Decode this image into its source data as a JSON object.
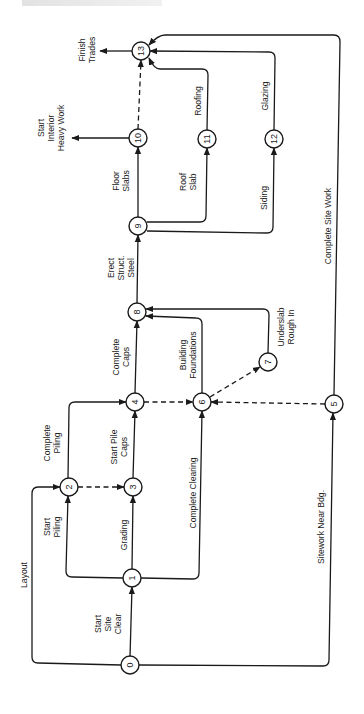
{
  "diagram": {
    "type": "activity-on-arrow network (rotated 90°)",
    "colors": {
      "stroke": "#1a1a1a",
      "background": "#ffffff"
    },
    "nodes": [
      {
        "id": "0",
        "x": 130,
        "y": 665
      },
      {
        "id": "1",
        "x": 132,
        "y": 578
      },
      {
        "id": "2",
        "x": 69,
        "y": 487
      },
      {
        "id": "3",
        "x": 133,
        "y": 487
      },
      {
        "id": "4",
        "x": 135,
        "y": 402
      },
      {
        "id": "5",
        "x": 334,
        "y": 404
      },
      {
        "id": "6",
        "x": 202,
        "y": 402
      },
      {
        "id": "7",
        "x": 268,
        "y": 362
      },
      {
        "id": "8",
        "x": 137,
        "y": 312
      },
      {
        "id": "9",
        "x": 138,
        "y": 226
      },
      {
        "id": "10",
        "x": 138,
        "y": 138
      },
      {
        "id": "11",
        "x": 207,
        "y": 139
      },
      {
        "id": "12",
        "x": 274,
        "y": 139
      },
      {
        "id": "13",
        "x": 141,
        "y": 51
      }
    ],
    "edges": [
      {
        "from": "0",
        "to": "1",
        "label": "Start Site Clear",
        "dashed": false
      },
      {
        "from": "0",
        "to": "2",
        "label": "Layout",
        "dashed": false
      },
      {
        "from": "0",
        "to": "5",
        "label": "Sitework Near Bdg.",
        "dashed": false
      },
      {
        "from": "1",
        "to": "2",
        "label": "Start Piling",
        "dashed": false
      },
      {
        "from": "1",
        "to": "3",
        "label": "Grading",
        "dashed": false
      },
      {
        "from": "1",
        "to": "6",
        "label": "Complete Clearing",
        "dashed": false
      },
      {
        "from": "2",
        "to": "3",
        "label": "",
        "dashed": true
      },
      {
        "from": "2",
        "to": "4",
        "label": "Complete Piling",
        "dashed": false
      },
      {
        "from": "3",
        "to": "4",
        "label": "Start Pile Caps",
        "dashed": false
      },
      {
        "from": "4",
        "to": "6",
        "label": "",
        "dashed": true
      },
      {
        "from": "4",
        "to": "8",
        "label": "Complete Caps",
        "dashed": false
      },
      {
        "from": "5",
        "to": "6",
        "label": "",
        "dashed": true
      },
      {
        "from": "5",
        "to": "13",
        "label": "Complete Site Work",
        "dashed": false
      },
      {
        "from": "6",
        "to": "7",
        "label": "",
        "dashed": true
      },
      {
        "from": "6",
        "to": "8",
        "label": "Building Foundations",
        "dashed": false
      },
      {
        "from": "7",
        "to": "8",
        "label": "Underslab Rough In",
        "dashed": false
      },
      {
        "from": "8",
        "to": "9",
        "label": "Erect Struct. Steel",
        "dashed": false
      },
      {
        "from": "9",
        "to": "10",
        "label": "Floor Slabs",
        "dashed": false
      },
      {
        "from": "9",
        "to": "11",
        "label": "Roof Slab",
        "dashed": false
      },
      {
        "from": "9",
        "to": "12",
        "label": "Siding",
        "dashed": false
      },
      {
        "from": "10",
        "to": "13",
        "label": "",
        "dashed": true
      },
      {
        "from": "10",
        "to": "out",
        "label": "Start Interior Heavy Work",
        "dashed": false
      },
      {
        "from": "11",
        "to": "13",
        "label": "Roofing",
        "dashed": false
      },
      {
        "from": "12",
        "to": "13",
        "label": "Glazing",
        "dashed": false
      },
      {
        "from": "13",
        "to": "out",
        "label": "Finish Trades",
        "dashed": false
      }
    ],
    "labels": {
      "layout": [
        "Layout"
      ],
      "start_site_clear": [
        "Start",
        "Site",
        "Clear"
      ],
      "start_piling": [
        "Start",
        "Piling"
      ],
      "grading": [
        "Grading"
      ],
      "complete_clearing": [
        "Complete Clearing"
      ],
      "complete_piling": [
        "Complete",
        "Piling"
      ],
      "start_pile_caps": [
        "Start Pile",
        "Caps"
      ],
      "sitework_near_bdg": [
        "Sitework Near Bdg."
      ],
      "complete_caps": [
        "Complete",
        "Caps"
      ],
      "building_foundations": [
        "Building",
        "Foundations"
      ],
      "underslab_rough_in": [
        "Underslab",
        "Rough In"
      ],
      "erect_struct_steel": [
        "Erect",
        "Struct.",
        "Steel"
      ],
      "floor_slabs": [
        "Floor",
        "Slabs"
      ],
      "roof_slab": [
        "Roof",
        "Slab"
      ],
      "siding": [
        "Siding"
      ],
      "roofing": [
        "Roofing"
      ],
      "glazing": [
        "Glazing"
      ],
      "complete_site_work": [
        "Complete Site Work"
      ],
      "start_interior_heavy_work": [
        "Start",
        "Interior",
        "Heavy Work"
      ],
      "finish_trades": [
        "Finish",
        "Trades"
      ]
    }
  }
}
